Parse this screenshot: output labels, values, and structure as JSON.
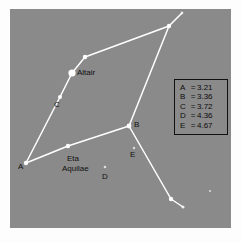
{
  "figure": {
    "background_color": "#8a8a8a",
    "page_color": "#fdfdfd",
    "star_color": "#ffffff",
    "line_color": "#ffffff",
    "text_color": "#101010"
  },
  "labels": {
    "altair": "Altair",
    "eta_line1": "Eta",
    "eta_line2": "Aquilae",
    "a": "A",
    "b": "B",
    "c": "C",
    "d": "D",
    "e": "E"
  },
  "legend": {
    "rows": [
      {
        "key": "A",
        "eq": "=",
        "value": "3.21"
      },
      {
        "key": "B",
        "eq": "=",
        "value": "3.36"
      },
      {
        "key": "C",
        "eq": "=",
        "value": "3.72"
      },
      {
        "key": "D",
        "eq": "=",
        "value": "4.36"
      },
      {
        "key": "E",
        "eq": "=",
        "value": "4.67"
      }
    ]
  },
  "chart_data": {
    "type": "scatter",
    "title": "",
    "xlabel": "",
    "ylabel": "",
    "grid": false,
    "legend_position": "right",
    "coordinate_space": "pixels-in-plot-area (221x219)",
    "stars": [
      {
        "id": "A",
        "label": "A",
        "x": 16,
        "y": 154,
        "radius": 2.2,
        "brightness": "medium",
        "magnitude": "3.21"
      },
      {
        "id": "B",
        "label": "B",
        "x": 119,
        "y": 117,
        "radius": 2.4,
        "brightness": "medium",
        "magnitude": "3.36"
      },
      {
        "id": "C",
        "label": "C",
        "x": 50,
        "y": 88,
        "radius": 2.0,
        "brightness": "medium",
        "magnitude": "3.72"
      },
      {
        "id": "D",
        "label": "D",
        "x": 95,
        "y": 158,
        "radius": 1.3,
        "brightness": "faint",
        "magnitude": "4.36"
      },
      {
        "id": "E",
        "label": "E",
        "x": 124,
        "y": 139,
        "radius": 1.2,
        "brightness": "faint",
        "magnitude": "4.67"
      },
      {
        "id": "ALT",
        "label": "Altair",
        "x": 62,
        "y": 64,
        "radius": 3.6,
        "brightness": "bright",
        "magnitude": ""
      },
      {
        "id": "ETA",
        "label": "Eta Aquilae",
        "x": 58,
        "y": 137,
        "radius": 2.2,
        "brightness": "medium",
        "magnitude": ""
      },
      {
        "id": "V1",
        "label": "",
        "x": 75,
        "y": 48,
        "radius": 2.2,
        "brightness": "medium",
        "magnitude": ""
      },
      {
        "id": "V2",
        "label": "",
        "x": 159,
        "y": 17,
        "radius": 2.2,
        "brightness": "medium",
        "magnitude": ""
      },
      {
        "id": "V3",
        "label": "",
        "x": 172,
        "y": 4,
        "radius": 1.4,
        "brightness": "faint",
        "magnitude": ""
      },
      {
        "id": "V4",
        "label": "",
        "x": 161,
        "y": 190,
        "radius": 2.2,
        "brightness": "medium",
        "magnitude": ""
      },
      {
        "id": "V5",
        "label": "",
        "x": 173,
        "y": 198,
        "radius": 1.6,
        "brightness": "faint",
        "magnitude": ""
      },
      {
        "id": "F1",
        "label": "",
        "x": 200,
        "y": 182,
        "radius": 1.0,
        "brightness": "faint",
        "magnitude": ""
      }
    ],
    "lines": [
      {
        "name": "A-to-C-to-Altair-to-V1-to-V2",
        "points": [
          [
            16,
            154
          ],
          [
            50,
            88
          ],
          [
            62,
            64
          ],
          [
            75,
            48
          ],
          [
            159,
            17
          ]
        ]
      },
      {
        "name": "V2-to-V3",
        "points": [
          [
            159,
            17
          ],
          [
            172,
            4
          ]
        ]
      },
      {
        "name": "V2-to-B",
        "points": [
          [
            159,
            17
          ],
          [
            119,
            117
          ]
        ]
      },
      {
        "name": "A-to-Eta-to-B",
        "points": [
          [
            16,
            154
          ],
          [
            58,
            137
          ],
          [
            119,
            117
          ]
        ]
      },
      {
        "name": "B-to-V4-to-V5",
        "points": [
          [
            119,
            117
          ],
          [
            161,
            190
          ],
          [
            173,
            198
          ]
        ]
      }
    ]
  },
  "label_positions": [
    {
      "key": "altair",
      "x": 67,
      "y": 59
    },
    {
      "key": "c",
      "x": 44,
      "y": 91
    },
    {
      "key": "a",
      "x": 8,
      "y": 153
    },
    {
      "key": "eta_line1",
      "x": 57,
      "y": 145
    },
    {
      "key": "eta_line2",
      "x": 52,
      "y": 154
    },
    {
      "key": "d",
      "x": 92,
      "y": 163
    },
    {
      "key": "b",
      "x": 124,
      "y": 112
    },
    {
      "key": "e",
      "x": 120,
      "y": 142
    }
  ]
}
